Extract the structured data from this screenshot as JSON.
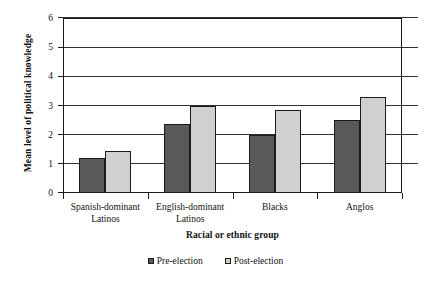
{
  "chart_data": {
    "type": "bar",
    "title": "",
    "xlabel": "Racial or ethnic group",
    "ylabel": "Mean level of political knowledge",
    "categories": [
      "Spanish-dominant Latinos",
      "English-dominant Latinos",
      "Blacks",
      "Anglos"
    ],
    "category_lines": [
      [
        "Spanish-dominant",
        "Latinos"
      ],
      [
        "English-dominant",
        "Latinos"
      ],
      [
        "Blacks",
        ""
      ],
      [
        "Anglos",
        ""
      ]
    ],
    "series": [
      {
        "name": "Pre-election",
        "values": [
          1.2,
          2.35,
          2.0,
          2.5
        ],
        "color": "#595959"
      },
      {
        "name": "Post-election",
        "values": [
          1.45,
          3.0,
          2.85,
          3.3
        ],
        "color": "#d0d0d0"
      }
    ],
    "ylim": [
      0,
      6
    ],
    "yticks": [
      0,
      1,
      2,
      3,
      4,
      5,
      6
    ],
    "ytick_labels": [
      "0",
      "1",
      "2",
      "3",
      "4",
      "5",
      "6"
    ],
    "grid": true,
    "grid_axis": "y",
    "legend_position": "bottom-center"
  },
  "axis": {
    "y_title": "Mean level of political knowledge",
    "x_title": "Racial or ethnic group"
  },
  "legend": {
    "items": [
      {
        "label": "Pre-election"
      },
      {
        "label": "Post-election"
      }
    ]
  },
  "colors": {
    "pre_election": "#595959",
    "post_election": "#d0d0d0",
    "axis": "#1b1b1b",
    "grid": "#303030",
    "background": "#ffffff"
  }
}
